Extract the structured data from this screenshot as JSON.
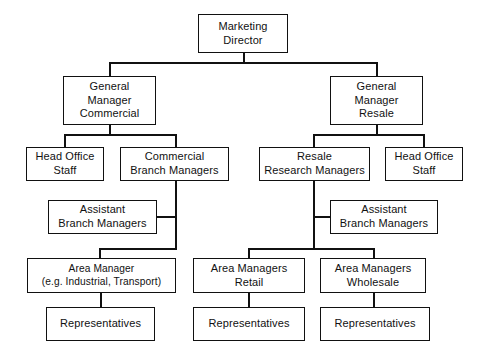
{
  "diagram": {
    "type": "org-chart",
    "style": {
      "line_color": "#111111",
      "box_fill": "#ffffff",
      "text_color": "#111111",
      "background": "#ffffff"
    },
    "nodes": [
      {
        "id": "marketing-director",
        "label": "Marketing\nDirector",
        "level": 0
      },
      {
        "id": "gm-commercial",
        "label": "General\nManager\nCommercial",
        "level": 1
      },
      {
        "id": "gm-resale",
        "label": "General\nManager\nResale",
        "level": 1
      },
      {
        "id": "head-office-staff-commercial",
        "label": "Head Office\nStaff",
        "level": 2
      },
      {
        "id": "commercial-branch-managers",
        "label": "Commercial\nBranch Managers",
        "level": 2
      },
      {
        "id": "resale-research-managers",
        "label": "Resale\nResearch Managers",
        "level": 2
      },
      {
        "id": "head-office-staff-resale",
        "label": "Head Office\nStaff",
        "level": 2
      },
      {
        "id": "assistant-branch-managers-commercial",
        "label": "Assistant\nBranch Managers",
        "level": 3
      },
      {
        "id": "assistant-branch-managers-resale",
        "label": "Assistant\nBranch Managers",
        "level": 3
      },
      {
        "id": "area-manager-industrial",
        "label": "Area Manager\n(e.g. Industrial, Transport)",
        "level": 4
      },
      {
        "id": "area-managers-retail",
        "label": "Area Managers\nRetail",
        "level": 4
      },
      {
        "id": "area-managers-wholesale",
        "label": "Area Managers\nWholesale",
        "level": 4
      },
      {
        "id": "representatives-industrial",
        "label": "Representatives",
        "level": 5
      },
      {
        "id": "representatives-retail",
        "label": "Representatives",
        "level": 5
      },
      {
        "id": "representatives-wholesale",
        "label": "Representatives",
        "level": 5
      }
    ],
    "edges": [
      {
        "from": "marketing-director",
        "to": "gm-commercial"
      },
      {
        "from": "marketing-director",
        "to": "gm-resale"
      },
      {
        "from": "gm-commercial",
        "to": "head-office-staff-commercial"
      },
      {
        "from": "gm-commercial",
        "to": "commercial-branch-managers"
      },
      {
        "from": "gm-resale",
        "to": "resale-research-managers"
      },
      {
        "from": "gm-resale",
        "to": "head-office-staff-resale"
      },
      {
        "from": "commercial-branch-managers",
        "to": "assistant-branch-managers-commercial"
      },
      {
        "from": "commercial-branch-managers",
        "to": "area-manager-industrial"
      },
      {
        "from": "resale-research-managers",
        "to": "assistant-branch-managers-resale"
      },
      {
        "from": "resale-research-managers",
        "to": "area-managers-retail"
      },
      {
        "from": "resale-research-managers",
        "to": "area-managers-wholesale"
      },
      {
        "from": "area-manager-industrial",
        "to": "representatives-industrial"
      },
      {
        "from": "area-managers-retail",
        "to": "representatives-retail"
      },
      {
        "from": "area-managers-wholesale",
        "to": "representatives-wholesale"
      }
    ]
  }
}
